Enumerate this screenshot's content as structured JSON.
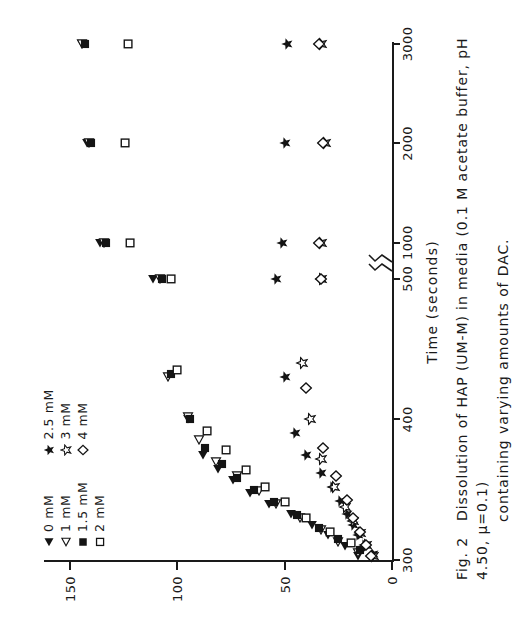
{
  "figure": {
    "label": "Fig. 2",
    "caption_line1": "Dissolution of HAP (UM-M) in media (0.1 M acetate buffer, pH 4.50,  μ=0.1)",
    "caption_line2": "containing varying amounts of DAC."
  },
  "legend": {
    "columns": [
      {
        "entries": [
          {
            "symbol": "filled-triangle-left",
            "label": "0 mM"
          },
          {
            "symbol": "open-triangle-left",
            "label": "1 mM"
          },
          {
            "symbol": "filled-square",
            "label": "1.5 mM"
          },
          {
            "symbol": "open-square",
            "label": "2 mM"
          }
        ]
      },
      {
        "entries": [
          {
            "symbol": "filled-star",
            "label": "2.5 mM"
          },
          {
            "symbol": "open-star",
            "label": "3 mM"
          },
          {
            "symbol": "open-diamond",
            "label": "4 mM"
          }
        ]
      }
    ]
  },
  "chart_data": {
    "type": "scatter",
    "title": "",
    "xlabel": "Time (seconds)",
    "ylabel": "",
    "xticks": [
      300,
      400,
      500,
      1000,
      2000,
      3000
    ],
    "xtick_labels": [
      "300",
      "400",
      "500",
      "1000",
      "2000",
      "3000"
    ],
    "yticks": [
      0,
      50,
      100,
      150
    ],
    "ytick_labels": [
      "0",
      "50",
      "100",
      "150"
    ],
    "ylim": [
      0,
      160
    ],
    "grid": false,
    "axis_break": true,
    "axis_break_between": [
      500,
      1000
    ],
    "legend_position": "top-left",
    "series": [
      {
        "name": "0 mM",
        "symbol": "filled-triangle-left",
        "points": [
          [
            303,
            16
          ],
          [
            310,
            22
          ],
          [
            318,
            30
          ],
          [
            325,
            37
          ],
          [
            333,
            47
          ],
          [
            340,
            57
          ],
          [
            348,
            66
          ],
          [
            357,
            74
          ],
          [
            365,
            81
          ],
          [
            375,
            88
          ],
          [
            400,
            95
          ],
          [
            500,
            111
          ],
          [
            1000,
            136
          ],
          [
            2000,
            142
          ],
          [
            3000,
            144
          ]
        ]
      },
      {
        "name": "1 mM",
        "symbol": "open-triangle-left",
        "points": [
          [
            305,
            16
          ],
          [
            313,
            25
          ],
          [
            321,
            33
          ],
          [
            330,
            43
          ],
          [
            340,
            54
          ],
          [
            349,
            62
          ],
          [
            360,
            72
          ],
          [
            370,
            82
          ],
          [
            385,
            90
          ],
          [
            402,
            95
          ],
          [
            430,
            104
          ],
          [
            500,
            108
          ],
          [
            1000,
            134
          ],
          [
            2000,
            141
          ],
          [
            3000,
            144
          ]
        ]
      },
      {
        "name": "1.5 mM",
        "symbol": "filled-square",
        "points": [
          [
            307,
            15
          ],
          [
            315,
            25
          ],
          [
            323,
            34
          ],
          [
            332,
            44
          ],
          [
            341,
            55
          ],
          [
            350,
            64
          ],
          [
            358,
            72
          ],
          [
            368,
            79
          ],
          [
            380,
            87
          ],
          [
            400,
            94
          ],
          [
            432,
            103
          ],
          [
            500,
            107
          ],
          [
            1000,
            133
          ],
          [
            2000,
            140
          ],
          [
            3000,
            143
          ]
        ]
      },
      {
        "name": "2 mM",
        "symbol": "open-square",
        "points": [
          [
            312,
            19
          ],
          [
            320,
            29
          ],
          [
            330,
            40
          ],
          [
            341,
            50
          ],
          [
            352,
            59
          ],
          [
            364,
            68
          ],
          [
            378,
            77
          ],
          [
            392,
            86
          ],
          [
            435,
            100
          ],
          [
            500,
            103
          ],
          [
            1000,
            122
          ],
          [
            2000,
            124
          ],
          [
            3000,
            123
          ]
        ]
      },
      {
        "name": "2.5 mM",
        "symbol": "filled-star",
        "points": [
          [
            304,
            9
          ],
          [
            311,
            13
          ],
          [
            318,
            16
          ],
          [
            325,
            18
          ],
          [
            333,
            21
          ],
          [
            342,
            24
          ],
          [
            352,
            28
          ],
          [
            362,
            33
          ],
          [
            375,
            40
          ],
          [
            390,
            45
          ],
          [
            430,
            50
          ],
          [
            500,
            54
          ],
          [
            1000,
            51
          ],
          [
            2000,
            50
          ],
          [
            3000,
            49
          ]
        ]
      },
      {
        "name": "3 mM",
        "symbol": "open-star",
        "points": [
          [
            303,
            9
          ],
          [
            311,
            12
          ],
          [
            319,
            15
          ],
          [
            328,
            18
          ],
          [
            338,
            22
          ],
          [
            352,
            27
          ],
          [
            372,
            33
          ],
          [
            400,
            38
          ],
          [
            440,
            42
          ],
          [
            500,
            33
          ],
          [
            1000,
            33
          ],
          [
            2000,
            31
          ],
          [
            3000,
            33
          ]
        ]
      },
      {
        "name": "4 mM",
        "symbol": "open-diamond",
        "points": [
          [
            303,
            10
          ],
          [
            311,
            12
          ],
          [
            320,
            15
          ],
          [
            330,
            18
          ],
          [
            343,
            21
          ],
          [
            360,
            26
          ],
          [
            380,
            32
          ],
          [
            422,
            40
          ],
          [
            500,
            33
          ],
          [
            1000,
            34
          ],
          [
            2000,
            32
          ],
          [
            3000,
            34
          ]
        ]
      }
    ]
  }
}
